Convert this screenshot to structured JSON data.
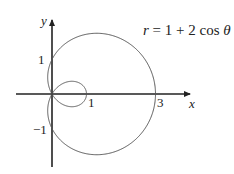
{
  "figure": {
    "equation": "r = 1 + 2 cos θ",
    "equation_parts": {
      "lhs": "r",
      "eq": " = 1 + 2 cos ",
      "theta": "θ"
    },
    "axes": {
      "x_label": "x",
      "y_label": "y"
    },
    "ticks": {
      "x_one": "1",
      "x_three": "3",
      "y_one": "1",
      "y_neg_one": "−1"
    },
    "colors": {
      "axis": "#222222",
      "curve": "#555555",
      "background": "#ffffff"
    }
  },
  "chart_data": {
    "type": "line",
    "xlabel": "x",
    "ylabel": "y",
    "polar_function": "r = 1 + 2*cos(theta)",
    "theta_range": [
      0,
      6.2832
    ],
    "x_intercepts": [
      3,
      1,
      0
    ],
    "y_intercepts": [
      1,
      -1
    ],
    "grid": false
  }
}
